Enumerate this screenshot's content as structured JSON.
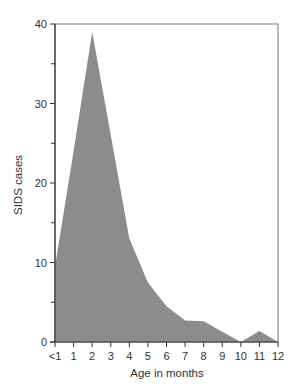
{
  "chart_data": {
    "type": "area",
    "title": "",
    "xlabel": "Age in months",
    "ylabel": "SIDS cases",
    "categories": [
      "<1",
      "1",
      "2",
      "3",
      "4",
      "5",
      "6",
      "7",
      "8",
      "9",
      "10",
      "11",
      "12"
    ],
    "series": [
      {
        "name": "SIDS cases",
        "values": [
          9.5,
          24,
          39,
          26,
          13,
          7.5,
          4.5,
          2.7,
          2.6,
          1.3,
          0,
          1.4,
          0
        ]
      }
    ],
    "ylim": [
      0,
      40
    ],
    "yticks": [
      0,
      10,
      20,
      30,
      40
    ],
    "yminor_ticks": [
      5,
      15,
      25,
      35
    ],
    "grid": false,
    "legend": "none",
    "colors": {
      "fill": "#8c8c8c",
      "axis": "#333333",
      "frame": "#777777"
    }
  }
}
